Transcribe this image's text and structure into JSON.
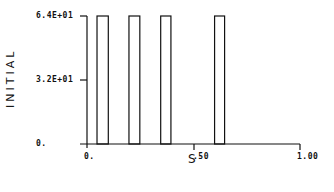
{
  "chart_data": {
    "type": "bar",
    "title": "",
    "xlabel": "S",
    "ylabel": "INITIAL",
    "xlim": [
      0,
      1.0
    ],
    "ylim": [
      0,
      64
    ],
    "x_ticks": [
      "0.",
      ".50",
      "1.00"
    ],
    "y_ticks": [
      "0.",
      "3.2E+01",
      "6.4E+01"
    ],
    "grid": false,
    "bars": [
      {
        "x_start": 0.047,
        "x_end": 0.1,
        "value": 64
      },
      {
        "x_start": 0.197,
        "x_end": 0.248,
        "value": 64
      },
      {
        "x_start": 0.346,
        "x_end": 0.394,
        "value": 64
      },
      {
        "x_start": 0.599,
        "x_end": 0.646,
        "value": 64
      }
    ]
  },
  "labels": {
    "ylabel": "INITIAL",
    "xlabel": "S",
    "y_top": "6.4E+01",
    "y_mid": "3.2E+01",
    "y_zero": "0.",
    "x_zero": "0.",
    "x_mid": ".50",
    "x_max": "1.00"
  }
}
